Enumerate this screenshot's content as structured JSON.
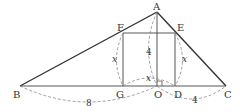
{
  "diagram": {
    "points": {
      "A": {
        "label": "A",
        "x": 157,
        "y": 12
      },
      "B": {
        "label": "B",
        "x": 20,
        "y": 86
      },
      "C": {
        "label": "C",
        "x": 226,
        "y": 86
      },
      "E": {
        "label": "E",
        "x": 175,
        "y": 33
      },
      "F": {
        "label": "F",
        "x": 123,
        "y": 33
      },
      "G": {
        "label": "G",
        "x": 123,
        "y": 86
      },
      "O": {
        "label": "O",
        "x": 157,
        "y": 86
      },
      "D": {
        "label": "D",
        "x": 175,
        "y": 86
      }
    },
    "measurements": {
      "BO": "8",
      "OC": "4",
      "AO": "4",
      "FG": "x",
      "ED": "x",
      "GD": "x"
    },
    "colors": {
      "line": "#333333",
      "dashed": "#888888",
      "text": "#333333"
    }
  }
}
